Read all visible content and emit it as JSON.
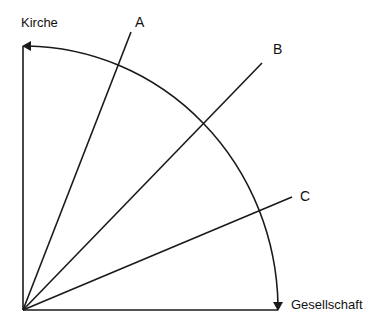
{
  "diagram": {
    "axis_vertical_label": "Kirche",
    "axis_horizontal_label": "Gesellschaft",
    "rays": [
      {
        "label": "A"
      },
      {
        "label": "B"
      },
      {
        "label": "C"
      }
    ],
    "stroke_color": "#1a1a1a"
  }
}
